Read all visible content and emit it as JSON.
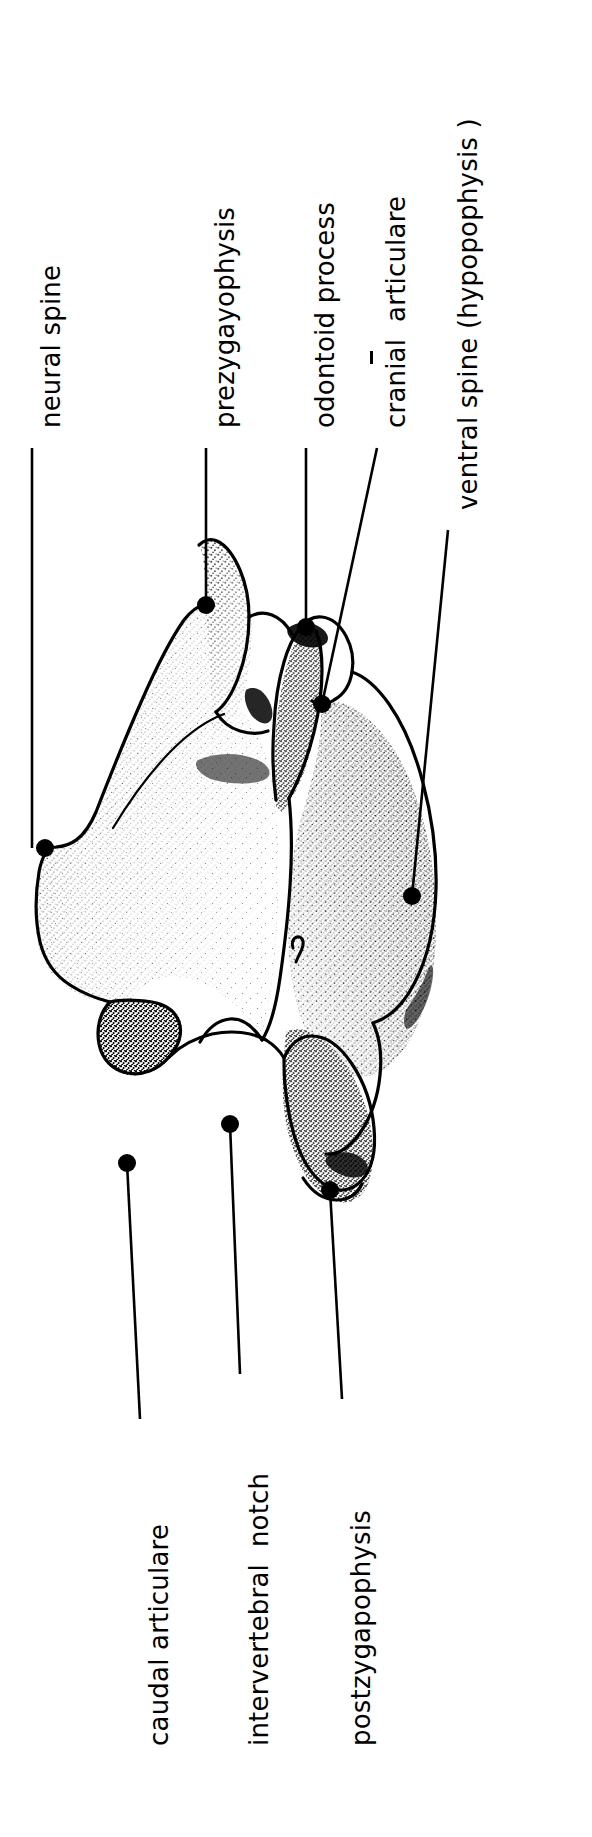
{
  "figure": {
    "kind": "anatomical-line-drawing",
    "subject": "vertebra",
    "view": "lateral",
    "background_color": "#ffffff",
    "ink_color": "#000000"
  },
  "labels": {
    "top": [
      {
        "id": "neural-spine",
        "text": "neural spine",
        "text_x": 38,
        "text_y": 428,
        "leader": {
          "x1": 32,
          "y1": 448,
          "x2": 32,
          "y2": 848
        },
        "dot": {
          "cx": 45,
          "cy": 848,
          "r": 9
        }
      },
      {
        "id": "prezygayophysis",
        "text": "prezygayophysis",
        "text_x": 212,
        "text_y": 428,
        "leader": {
          "x1": 206,
          "y1": 448,
          "x2": 206,
          "y2": 605
        },
        "dot": {
          "cx": 206,
          "cy": 605,
          "r": 9
        }
      },
      {
        "id": "odontoid-process",
        "text": "odontoid process",
        "text_x": 312,
        "text_y": 428,
        "leader": {
          "x1": 306,
          "y1": 448,
          "x2": 306,
          "y2": 627
        },
        "dot": {
          "cx": 306,
          "cy": 627,
          "r": 9
        }
      },
      {
        "id": "cranial-articulare",
        "text": "cranial  articulare",
        "text_x": 383,
        "text_y": 428,
        "leader": {
          "x1": 377,
          "y1": 448,
          "x2": 322,
          "y2": 704
        },
        "dot": {
          "cx": 322,
          "cy": 704,
          "r": 9
        }
      },
      {
        "id": "ventral-spine",
        "text": "ventral spine (hypopophysis )",
        "text_x": 455,
        "text_y": 510,
        "leader": {
          "x1": 448,
          "y1": 530,
          "x2": 412,
          "y2": 896
        },
        "dot": {
          "cx": 412,
          "cy": 896,
          "r": 9
        }
      }
    ],
    "bottom": [
      {
        "id": "caudal-articulare",
        "text": "caudal articulare",
        "text_x": 146,
        "text_y": 1746,
        "leader": {
          "x1": 140,
          "y1": 1419,
          "x2": 127,
          "y2": 1163
        },
        "dot": {
          "cx": 127,
          "cy": 1163,
          "r": 9
        }
      },
      {
        "id": "intervertebral-notch",
        "text": "intervertebral  notch",
        "text_x": 246,
        "text_y": 1746,
        "leader": {
          "x1": 240,
          "y1": 1374,
          "x2": 230,
          "y2": 1124
        },
        "dot": {
          "cx": 230,
          "cy": 1124,
          "r": 9
        }
      },
      {
        "id": "postzygapophysis",
        "text": "postzygapophysis",
        "text_x": 348,
        "text_y": 1746,
        "leader": {
          "x1": 342,
          "y1": 1399,
          "x2": 330,
          "y2": 1190
        },
        "dot": {
          "cx": 330,
          "cy": 1190,
          "r": 9
        }
      }
    ]
  },
  "separator_mark": {
    "id": "cranial-articulare-divider",
    "x": 370,
    "y": 351,
    "width": 3,
    "height": 13
  }
}
